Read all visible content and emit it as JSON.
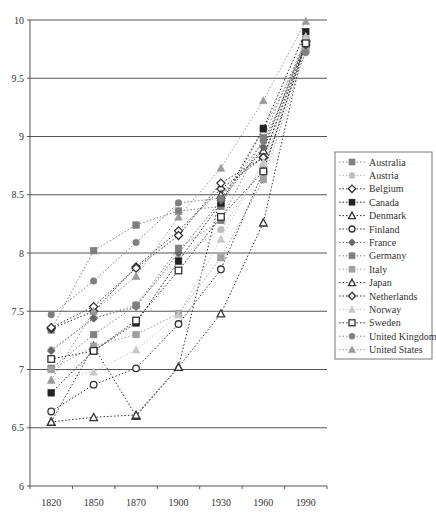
{
  "chart_data": {
    "type": "line",
    "title": "",
    "xlabel": "",
    "ylabel": "",
    "ylim": [
      6,
      10
    ],
    "yticks": [
      6,
      6.5,
      7,
      7.5,
      8,
      8.5,
      9,
      9.5,
      10
    ],
    "ytick_labels": [
      "6",
      "6.5",
      "7",
      "7.5",
      "8",
      "8.5",
      "9",
      "9.5",
      "10"
    ],
    "grid": "horizontal",
    "legend_position": "right",
    "categories": [
      "1820",
      "1850",
      "1870",
      "1900",
      "1930",
      "1960",
      "1990"
    ],
    "series": [
      {
        "name": "Australia",
        "marker": "square",
        "color": "#7f7f7f",
        "values": [
          7.34,
          8.02,
          8.24,
          8.36,
          8.4,
          9.06,
          9.77
        ]
      },
      {
        "name": "Austria",
        "marker": "circle",
        "color": "#bdbdbd",
        "values": [
          7.17,
          7.44,
          7.56,
          7.96,
          8.2,
          8.75,
          9.8
        ]
      },
      {
        "name": "Belgium",
        "marker": "diamond-open",
        "color": "#333333",
        "values": [
          7.35,
          7.5,
          7.88,
          8.19,
          8.55,
          8.82,
          9.82
        ]
      },
      {
        "name": "Canada",
        "marker": "square",
        "color": "#222222",
        "values": [
          6.8,
          7.16,
          7.4,
          7.93,
          8.43,
          9.07,
          9.9
        ]
      },
      {
        "name": "Denmark",
        "marker": "triangle-open",
        "color": "#333333",
        "values": [
          6.55,
          7.2,
          6.6,
          7.02,
          8.5,
          8.88,
          9.84
        ]
      },
      {
        "name": "Finland",
        "marker": "circle-open",
        "color": "#333333",
        "values": [
          6.64,
          6.87,
          7.01,
          7.39,
          7.86,
          8.7,
          9.79
        ]
      },
      {
        "name": "France",
        "marker": "diamond",
        "color": "#666666",
        "values": [
          7.16,
          7.44,
          7.54,
          8.0,
          8.45,
          8.91,
          9.81
        ]
      },
      {
        "name": "Germany",
        "marker": "square",
        "color": "#7f7f7f",
        "values": [
          7.01,
          7.3,
          7.55,
          8.04,
          8.28,
          8.99,
          9.83
        ]
      },
      {
        "name": "Italy",
        "marker": "square",
        "color": "#a0a0a0",
        "values": [
          7.0,
          7.2,
          7.3,
          7.48,
          7.96,
          8.63,
          9.74
        ]
      },
      {
        "name": "Japan",
        "marker": "triangle-open",
        "color": "#333333",
        "values": [
          6.55,
          6.59,
          6.61,
          7.02,
          7.48,
          8.26,
          9.85
        ]
      },
      {
        "name": "Netherlands",
        "marker": "diamond-open",
        "color": "#333333",
        "values": [
          7.36,
          7.54,
          7.87,
          8.15,
          8.6,
          8.82,
          9.79
        ]
      },
      {
        "name": "Norway",
        "marker": "triangle",
        "color": "#c8c8c8",
        "values": [
          6.91,
          6.98,
          7.17,
          7.47,
          8.12,
          8.78,
          9.86
        ]
      },
      {
        "name": "Sweden",
        "marker": "square-open",
        "color": "#333333",
        "values": [
          7.09,
          7.16,
          7.42,
          7.85,
          8.31,
          8.7,
          9.8
        ]
      },
      {
        "name": "United Kingdom",
        "marker": "circle",
        "color": "#7f7f7f",
        "values": [
          7.47,
          7.76,
          8.09,
          8.43,
          8.47,
          8.96,
          9.72
        ]
      },
      {
        "name": "United States",
        "marker": "triangle",
        "color": "#9a9a9a",
        "values": [
          6.91,
          7.5,
          7.8,
          8.31,
          8.73,
          9.31,
          9.99
        ]
      }
    ]
  }
}
